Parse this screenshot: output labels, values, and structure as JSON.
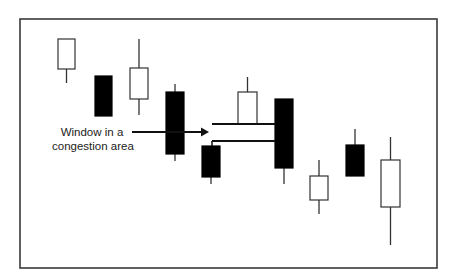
{
  "diagram": {
    "title": "Window in a congestion area",
    "annotation": {
      "line1": "Window in a",
      "line2": "congestion area"
    },
    "colors": {
      "frame": "#3a3a3a",
      "bullish_fill": "#ffffff",
      "bearish_fill": "#000000",
      "outline": "#333333",
      "text": "#222222"
    },
    "frame": {
      "x": 20,
      "y": 19,
      "width": 417,
      "height": 249
    },
    "candles": [
      {
        "index": 1,
        "type": "white",
        "x": 58,
        "width": 17,
        "body_top": 39,
        "body_bottom": 69,
        "wick_high": 39,
        "wick_low": 83
      },
      {
        "index": 2,
        "type": "black",
        "x": 95,
        "width": 17,
        "body_top": 76,
        "body_bottom": 116,
        "wick_high": 76,
        "wick_low": 116
      },
      {
        "index": 3,
        "type": "white",
        "x": 130,
        "width": 18,
        "body_top": 68,
        "body_bottom": 99,
        "wick_high": 39,
        "wick_low": 115
      },
      {
        "index": 4,
        "type": "black",
        "x": 166,
        "width": 18,
        "body_top": 92,
        "body_bottom": 154,
        "wick_high": 84,
        "wick_low": 161
      },
      {
        "index": 5,
        "type": "black",
        "x": 202,
        "width": 18,
        "body_top": 146,
        "body_bottom": 177,
        "wick_high": 146,
        "wick_low": 184
      },
      {
        "index": 6,
        "type": "white",
        "x": 238,
        "width": 19,
        "body_top": 92,
        "body_bottom": 124,
        "wick_high": 77,
        "wick_low": 124
      },
      {
        "index": 7,
        "type": "black",
        "x": 275,
        "width": 18,
        "body_top": 99,
        "body_bottom": 168,
        "wick_high": 99,
        "wick_low": 184
      },
      {
        "index": 8,
        "type": "white",
        "x": 310,
        "width": 18,
        "body_top": 176,
        "body_bottom": 200,
        "wick_high": 160,
        "wick_low": 214
      },
      {
        "index": 9,
        "type": "black",
        "x": 346,
        "width": 18,
        "body_top": 145,
        "body_bottom": 176,
        "wick_high": 129,
        "wick_low": 176
      },
      {
        "index": 10,
        "type": "white",
        "x": 381,
        "width": 19,
        "body_top": 160,
        "body_bottom": 207,
        "wick_high": 137,
        "wick_low": 245
      }
    ],
    "window_lines": [
      {
        "x1": 212,
        "x2": 275,
        "y": 124
      },
      {
        "x1": 212,
        "x2": 275,
        "y": 141
      }
    ],
    "connector": {
      "x": 212,
      "y1": 141,
      "y2": 146
    },
    "arrow": {
      "x1": 132,
      "x2": 209,
      "y": 132
    }
  }
}
